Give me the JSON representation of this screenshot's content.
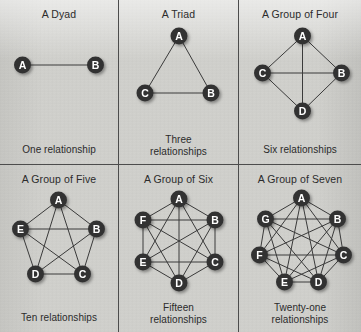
{
  "figure": {
    "background_color": "#d2d2ce",
    "node_color": "#333333",
    "node_label_color": "#ffffff",
    "edge_color": "#3a3a3a",
    "divider_color": "#4c4c4c"
  },
  "cells": [
    {
      "title": "A Dyad",
      "caption": "One relationship",
      "caption_lines": [
        "One relationship"
      ],
      "node_count": 2,
      "edge_count": 1,
      "nodes": [
        {
          "label": "A",
          "x": 23,
          "y": 44
        },
        {
          "label": "B",
          "x": 96,
          "y": 44
        }
      ],
      "edges": [
        [
          "A",
          "B"
        ]
      ]
    },
    {
      "title": "A Triad",
      "caption": "Three relationships",
      "caption_lines": [
        "Three",
        "relationships"
      ],
      "node_count": 3,
      "edge_count": 3,
      "nodes": [
        {
          "label": "A",
          "x": 60,
          "y": 15
        },
        {
          "label": "B",
          "x": 92,
          "y": 72
        },
        {
          "label": "C",
          "x": 26,
          "y": 72
        }
      ],
      "edges": [
        [
          "A",
          "B"
        ],
        [
          "A",
          "C"
        ],
        [
          "C",
          "B"
        ]
      ]
    },
    {
      "title": "A Group of Four",
      "caption": "Six relationships",
      "caption_lines": [
        "Six relationships"
      ],
      "node_count": 4,
      "edge_count": 6,
      "nodes": [
        {
          "label": "A",
          "x": 62,
          "y": 15
        },
        {
          "label": "B",
          "x": 101,
          "y": 52
        },
        {
          "label": "C",
          "x": 22,
          "y": 52
        },
        {
          "label": "D",
          "x": 62,
          "y": 90
        }
      ],
      "edges": [
        [
          "A",
          "B"
        ],
        [
          "A",
          "C"
        ],
        [
          "A",
          "D"
        ],
        [
          "B",
          "C"
        ],
        [
          "B",
          "D"
        ],
        [
          "C",
          "D"
        ]
      ]
    },
    {
      "title": "A Group of Five",
      "caption": "Ten relationships",
      "caption_lines": [
        "Ten relationships"
      ],
      "node_count": 5,
      "edge_count": 10,
      "nodes": [
        {
          "label": "A",
          "x": 59,
          "y": 14
        },
        {
          "label": "B",
          "x": 97,
          "y": 43
        },
        {
          "label": "C",
          "x": 83,
          "y": 88
        },
        {
          "label": "D",
          "x": 36,
          "y": 88
        },
        {
          "label": "E",
          "x": 21,
          "y": 43
        }
      ],
      "edges": [
        [
          "A",
          "B"
        ],
        [
          "A",
          "C"
        ],
        [
          "A",
          "D"
        ],
        [
          "A",
          "E"
        ],
        [
          "B",
          "C"
        ],
        [
          "B",
          "D"
        ],
        [
          "B",
          "E"
        ],
        [
          "C",
          "D"
        ],
        [
          "C",
          "E"
        ],
        [
          "D",
          "E"
        ]
      ]
    },
    {
      "title": "A Group of Six",
      "caption": "Fifteen relationships",
      "caption_lines": [
        "Fifteen",
        "relationships"
      ],
      "node_count": 6,
      "edge_count": 15,
      "nodes": [
        {
          "label": "A",
          "x": 60,
          "y": 13
        },
        {
          "label": "B",
          "x": 96,
          "y": 34
        },
        {
          "label": "C",
          "x": 96,
          "y": 76
        },
        {
          "label": "D",
          "x": 60,
          "y": 97
        },
        {
          "label": "E",
          "x": 24,
          "y": 76
        },
        {
          "label": "F",
          "x": 24,
          "y": 34
        }
      ],
      "edges": [
        [
          "A",
          "B"
        ],
        [
          "A",
          "C"
        ],
        [
          "A",
          "D"
        ],
        [
          "A",
          "E"
        ],
        [
          "A",
          "F"
        ],
        [
          "B",
          "C"
        ],
        [
          "B",
          "D"
        ],
        [
          "B",
          "E"
        ],
        [
          "B",
          "F"
        ],
        [
          "C",
          "D"
        ],
        [
          "C",
          "E"
        ],
        [
          "C",
          "F"
        ],
        [
          "D",
          "E"
        ],
        [
          "D",
          "F"
        ],
        [
          "E",
          "F"
        ]
      ]
    },
    {
      "title": "A Group of Seven",
      "caption": "Twenty-one relationships",
      "caption_lines": [
        "Twenty-one",
        "relationships"
      ],
      "node_count": 7,
      "edge_count": 21,
      "nodes": [
        {
          "label": "A",
          "x": 61,
          "y": 12
        },
        {
          "label": "B",
          "x": 97,
          "y": 33
        },
        {
          "label": "C",
          "x": 103,
          "y": 69
        },
        {
          "label": "D",
          "x": 78,
          "y": 96
        },
        {
          "label": "E",
          "x": 44,
          "y": 96
        },
        {
          "label": "F",
          "x": 19,
          "y": 69
        },
        {
          "label": "G",
          "x": 25,
          "y": 33
        }
      ],
      "edges": [
        [
          "A",
          "B"
        ],
        [
          "A",
          "C"
        ],
        [
          "A",
          "D"
        ],
        [
          "A",
          "E"
        ],
        [
          "A",
          "F"
        ],
        [
          "A",
          "G"
        ],
        [
          "B",
          "C"
        ],
        [
          "B",
          "D"
        ],
        [
          "B",
          "E"
        ],
        [
          "B",
          "F"
        ],
        [
          "B",
          "G"
        ],
        [
          "C",
          "D"
        ],
        [
          "C",
          "E"
        ],
        [
          "C",
          "F"
        ],
        [
          "C",
          "G"
        ],
        [
          "D",
          "E"
        ],
        [
          "D",
          "F"
        ],
        [
          "D",
          "G"
        ],
        [
          "E",
          "F"
        ],
        [
          "E",
          "G"
        ],
        [
          "F",
          "G"
        ]
      ]
    }
  ]
}
